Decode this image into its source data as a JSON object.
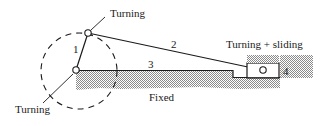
{
  "diagram": {
    "labels": {
      "turning_top": "Turning",
      "turning_bottom": "Turning",
      "turning_sliding": "Turning + sliding",
      "fixed": "Fixed"
    },
    "links": {
      "link1": "1",
      "link2": "2",
      "link3": "3",
      "link4": "4"
    },
    "colors": {
      "line": "#1a1a1a",
      "ground_hatch": "#9a9a9a",
      "background": "#ffffff"
    }
  }
}
